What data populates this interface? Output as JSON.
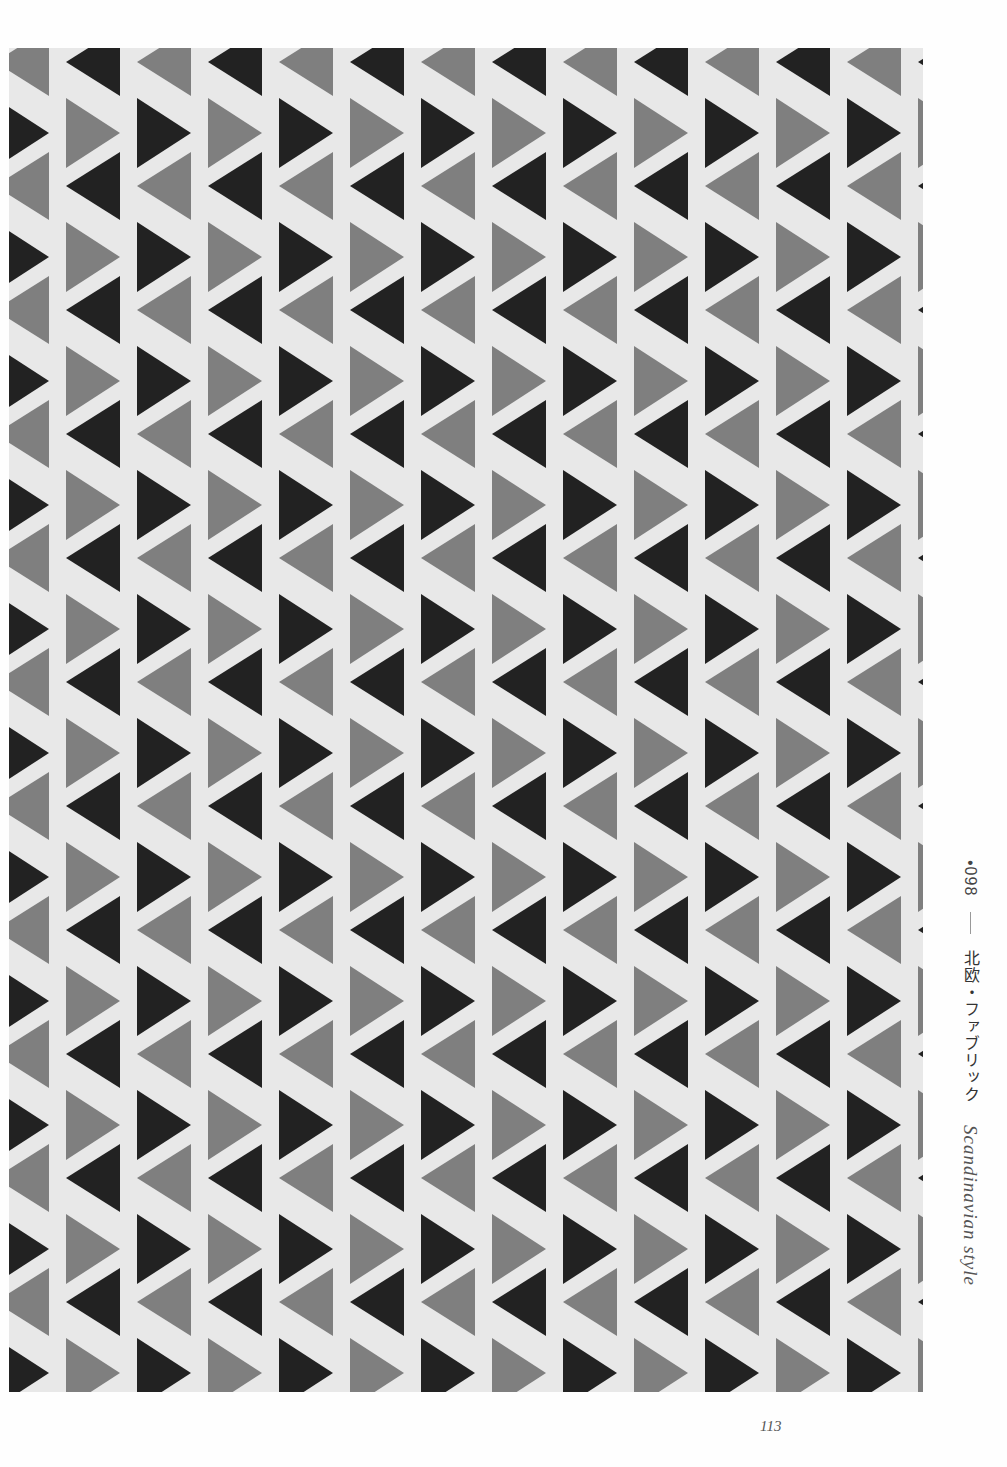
{
  "page": {
    "background": "#fefefe",
    "folio": "113"
  },
  "caption": {
    "number": "•098",
    "title_jp": "北欧・ファブリック",
    "title_en": "Scandinavian style"
  },
  "pattern": {
    "name": "triangle-fabric-pattern",
    "colors": {
      "ground": "#e8e8e8",
      "dark": "#222222",
      "gray": "#7f7f7f"
    },
    "column_width": 71,
    "row_period": 124
  }
}
